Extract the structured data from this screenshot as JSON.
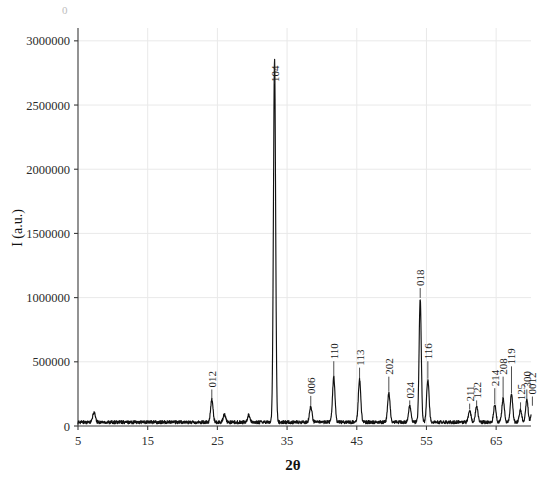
{
  "chart_data": {
    "type": "line",
    "title": "",
    "xlabel": "2θ",
    "ylabel": "I (a.u.)",
    "xlim": [
      5,
      70
    ],
    "ylim": [
      0,
      3100000
    ],
    "grid": true,
    "legend": "none",
    "xticks": [
      5,
      15,
      25,
      35,
      45,
      55,
      65
    ],
    "xtick_labels": [
      "5",
      "15",
      "25",
      "35",
      "45",
      "55",
      "65"
    ],
    "yticks": [
      0,
      500000,
      1000000,
      1500000,
      2000000,
      2500000,
      3000000
    ],
    "ytick_labels": [
      "0",
      "500000",
      "1000000",
      "1500000",
      "2000000",
      "2500000",
      "3000000"
    ],
    "series_name": "XRD pattern",
    "baseline": 30000,
    "peaks": [
      {
        "label": "012",
        "two_theta": 24.2,
        "intensity": 175000,
        "label_y": 300000
      },
      {
        "label": "104",
        "two_theta": 33.2,
        "intensity": 2820000,
        "label_y": 2680000
      },
      {
        "label": "006",
        "two_theta": 38.4,
        "intensity": 120000,
        "label_y": 250000
      },
      {
        "label": "110",
        "two_theta": 41.7,
        "intensity": 350000,
        "label_y": 520000
      },
      {
        "label": "113",
        "two_theta": 45.4,
        "intensity": 330000,
        "label_y": 470000
      },
      {
        "label": "202",
        "two_theta": 49.6,
        "intensity": 230000,
        "label_y": 400000
      },
      {
        "label": "024",
        "two_theta": 52.6,
        "intensity": 130000,
        "label_y": 215000
      },
      {
        "label": "018",
        "two_theta": 54.1,
        "intensity": 960000,
        "label_y": 1090000
      },
      {
        "label": "116",
        "two_theta": 55.2,
        "intensity": 330000,
        "label_y": 520000
      },
      {
        "label": "211",
        "two_theta": 61.2,
        "intensity": 90000,
        "label_y": 190000
      },
      {
        "label": "122",
        "two_theta": 62.2,
        "intensity": 120000,
        "label_y": 215000
      },
      {
        "label": "214",
        "two_theta": 64.8,
        "intensity": 130000,
        "label_y": 310000
      },
      {
        "label": "208",
        "two_theta": 66.0,
        "intensity": 185000,
        "label_y": 400000
      },
      {
        "label": "119",
        "two_theta": 67.2,
        "intensity": 215000,
        "label_y": 480000
      },
      {
        "label": "125",
        "two_theta": 68.5,
        "intensity": 95000,
        "label_y": 200000
      },
      {
        "label": "300",
        "two_theta": 69.4,
        "intensity": 175000,
        "label_y": 300000
      },
      {
        "label": "0012",
        "two_theta": 70.2,
        "intensity": 120000,
        "label_y": 245000
      }
    ],
    "minor_bumps": [
      {
        "two_theta": 7.3,
        "intensity": 78000
      },
      {
        "two_theta": 26.0,
        "intensity": 60000
      },
      {
        "two_theta": 29.5,
        "intensity": 55000
      }
    ]
  },
  "corner": {
    "mark": "0"
  }
}
